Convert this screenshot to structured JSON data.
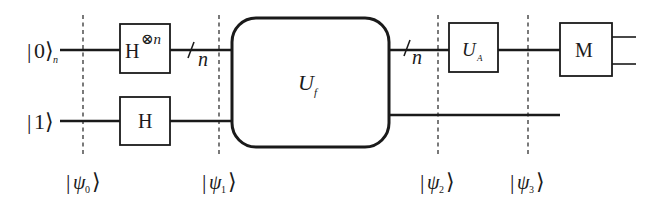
{
  "diagram": {
    "type": "quantum-circuit",
    "inputs": {
      "top": {
        "ket": "0",
        "subscript": "n"
      },
      "bottom": {
        "ket": "1"
      }
    },
    "gates": {
      "h_tensor": {
        "base": "H",
        "superscript": "⊗n"
      },
      "h": {
        "label": "H"
      },
      "oracle": {
        "base": "U",
        "subscript": "f"
      },
      "ua": {
        "base": "U",
        "subscript": "A"
      },
      "measure": {
        "label": "M"
      }
    },
    "bus_labels": {
      "after_h": "n",
      "after_oracle": "n"
    },
    "states": [
      {
        "symbol": "ψ",
        "index": "0"
      },
      {
        "symbol": "ψ",
        "index": "1"
      },
      {
        "symbol": "ψ",
        "index": "2"
      },
      {
        "symbol": "ψ",
        "index": "3"
      }
    ]
  }
}
